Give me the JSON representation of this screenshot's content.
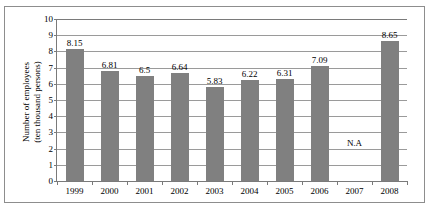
{
  "chart_data": {
    "type": "bar",
    "title": "",
    "subtitle": "",
    "xlabel": "",
    "ylabel": "Number of employees (ten thousand persons)",
    "ylabel_lines": [
      "Number of employees",
      "(ten thousand persons)"
    ],
    "categories": [
      "1999",
      "2000",
      "2001",
      "2002",
      "2003",
      "2004",
      "2005",
      "2006",
      "2007",
      "2008"
    ],
    "values": [
      8.15,
      6.81,
      6.5,
      6.64,
      5.83,
      6.22,
      6.31,
      7.09,
      null,
      8.65
    ],
    "data_labels": [
      "8.15",
      "6.81",
      "6.5",
      "6.64",
      "5.83",
      "6.22",
      "6.31",
      "7.09",
      "N.A",
      "8.65"
    ],
    "missing_label": "N.A",
    "missing_category": "2007",
    "missing_label_y": 2,
    "ylim": [
      0,
      10
    ],
    "ytick_labels": [
      "0",
      "1",
      "2",
      "3",
      "4",
      "5",
      "6",
      "7",
      "8",
      "9",
      "10"
    ],
    "ytick_values": [
      0,
      1,
      2,
      3,
      4,
      5,
      6,
      7,
      8,
      9,
      10
    ],
    "grid": true,
    "grid_axis": "y",
    "legend": false,
    "legend_position": "none",
    "bar_color": "#808080",
    "grid_color": "#9a9a9a",
    "axis_color": "#7a7a7a",
    "frame_color": "#8d8d8d",
    "background_color": "#ffffff",
    "text_color": "#000000"
  }
}
